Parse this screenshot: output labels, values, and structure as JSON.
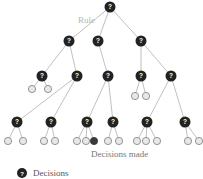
{
  "title_label": "Rule",
  "decisions_made_label": "Decisions made",
  "legend": {
    "label": "Decisions",
    "icon": "question-node-icon"
  },
  "node_glyph": "?",
  "colors": {
    "decision_node": "#222222",
    "leaf_fill": "#e8e8e8",
    "leaf_stroke": "#8a8a8a",
    "chosen_leaf": "#3a3a3a",
    "edge": "#b0b0b0",
    "label_gray": "#b5b5b5",
    "text_dark": "#555555"
  },
  "tree": {
    "decision_nodes": [
      {
        "id": "root",
        "level": 0
      },
      {
        "id": "a",
        "level": 1,
        "parent": "root"
      },
      {
        "id": "b",
        "level": 1,
        "parent": "root"
      },
      {
        "id": "c",
        "level": 1,
        "parent": "root"
      },
      {
        "id": "a1",
        "level": 2,
        "parent": "a"
      },
      {
        "id": "a2",
        "level": 2,
        "parent": "a"
      },
      {
        "id": "b1",
        "level": 2,
        "parent": "b"
      },
      {
        "id": "c1",
        "level": 2,
        "parent": "c"
      },
      {
        "id": "c2",
        "level": 2,
        "parent": "c"
      },
      {
        "id": "a2x",
        "level": 3,
        "parent": "a2"
      },
      {
        "id": "a2y",
        "level": 3,
        "parent": "a2"
      },
      {
        "id": "b1x",
        "level": 3,
        "parent": "b1"
      },
      {
        "id": "b1y",
        "level": 3,
        "parent": "b1"
      },
      {
        "id": "c2x",
        "level": 3,
        "parent": "c2"
      },
      {
        "id": "c2y",
        "level": 3,
        "parent": "c2"
      }
    ],
    "leaves": [
      {
        "parent": "a1",
        "chosen": false
      },
      {
        "parent": "a1",
        "chosen": false
      },
      {
        "parent": "c1",
        "chosen": false
      },
      {
        "parent": "c1",
        "chosen": false
      },
      {
        "parent": "a2x",
        "chosen": false
      },
      {
        "parent": "a2x",
        "chosen": false
      },
      {
        "parent": "a2y",
        "chosen": false
      },
      {
        "parent": "a2y",
        "chosen": false
      },
      {
        "parent": "b1x",
        "chosen": false
      },
      {
        "parent": "b1x",
        "chosen": false
      },
      {
        "parent": "b1x",
        "chosen": true
      },
      {
        "parent": "b1y",
        "chosen": false
      },
      {
        "parent": "b1y",
        "chosen": false
      },
      {
        "parent": "c2x",
        "chosen": false
      },
      {
        "parent": "c2x",
        "chosen": false
      },
      {
        "parent": "c2x",
        "chosen": false
      },
      {
        "parent": "c2y",
        "chosen": false
      },
      {
        "parent": "c2y",
        "chosen": false
      }
    ]
  }
}
